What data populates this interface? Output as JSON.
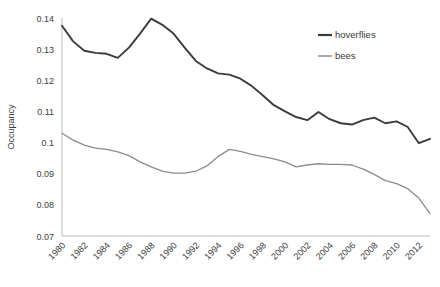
{
  "chart_data": {
    "type": "line",
    "title": "",
    "xlabel": "",
    "ylabel": "Occupancy",
    "ylim": [
      0.07,
      0.14
    ],
    "xlim": [
      1980,
      2013
    ],
    "ytick_labels": [
      "0.14",
      "0.13",
      "0.12",
      "0.11",
      "0.1",
      "0.09",
      "0.08",
      "0.07"
    ],
    "ytick_values": [
      0.14,
      0.13,
      0.12,
      0.11,
      0.1,
      0.09,
      0.08,
      0.07
    ],
    "xtick_labels": [
      "1980",
      "1982",
      "1984",
      "1986",
      "1988",
      "1990",
      "1992",
      "1994",
      "1996",
      "1998",
      "2000",
      "2002",
      "2004",
      "2006",
      "2008",
      "2010",
      "2012"
    ],
    "xtick_values": [
      1980,
      1982,
      1984,
      1986,
      1988,
      1990,
      1992,
      1994,
      1996,
      1998,
      2000,
      2002,
      2004,
      2006,
      2008,
      2010,
      2012
    ],
    "grid": false,
    "legend_position": "top-right",
    "x": [
      1980,
      1981,
      1982,
      1983,
      1984,
      1985,
      1986,
      1987,
      1988,
      1989,
      1990,
      1991,
      1992,
      1993,
      1994,
      1995,
      1996,
      1997,
      1998,
      1999,
      2000,
      2001,
      2002,
      2003,
      2004,
      2005,
      2006,
      2007,
      2008,
      2009,
      2010,
      2011,
      2012,
      2013
    ],
    "series": [
      {
        "name": "hoverflies",
        "color": "#3b3b3b",
        "values": [
          0.1375,
          0.1325,
          0.1295,
          0.1288,
          0.1285,
          0.1272,
          0.1305,
          0.135,
          0.1398,
          0.1378,
          0.135,
          0.1305,
          0.1262,
          0.1238,
          0.1222,
          0.1218,
          0.1205,
          0.1182,
          0.1152,
          0.112,
          0.11,
          0.1082,
          0.1072,
          0.1098,
          0.1075,
          0.1062,
          0.1058,
          0.1072,
          0.108,
          0.1062,
          0.1068,
          0.105,
          0.0998,
          0.1012
        ]
      },
      {
        "name": "bees",
        "color": "#8c8c8c",
        "values": [
          0.103,
          0.1008,
          0.0992,
          0.0982,
          0.0978,
          0.097,
          0.0958,
          0.0938,
          0.0922,
          0.0908,
          0.0902,
          0.0902,
          0.0908,
          0.0925,
          0.0955,
          0.0978,
          0.0972,
          0.0962,
          0.0955,
          0.0948,
          0.0938,
          0.0922,
          0.0928,
          0.0932,
          0.093,
          0.093,
          0.0928,
          0.0915,
          0.0898,
          0.0878,
          0.0868,
          0.0852,
          0.0822,
          0.0772
        ]
      }
    ]
  },
  "legend": {
    "items": [
      {
        "label": "hoverflies"
      },
      {
        "label": "bees"
      }
    ]
  },
  "axis": {
    "y_title": "Occupancy"
  }
}
